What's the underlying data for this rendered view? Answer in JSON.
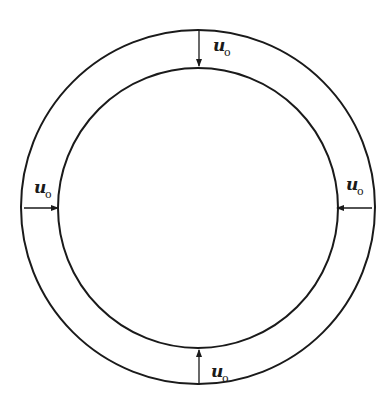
{
  "diagram": {
    "type": "annular ring with inward radial displacement arrows",
    "colors": {
      "stroke": "#1a1a1a",
      "background": "#ffffff"
    },
    "geometry": {
      "center": [
        198,
        208
      ],
      "outer_radius": 176,
      "inner_radius": 140
    },
    "labels": {
      "top": {
        "main": "u",
        "sub": "o"
      },
      "left": {
        "main": "u",
        "sub": "o"
      },
      "right": {
        "main": "u",
        "sub": "o"
      },
      "bottom": {
        "main": "u",
        "sub": "o"
      }
    }
  }
}
